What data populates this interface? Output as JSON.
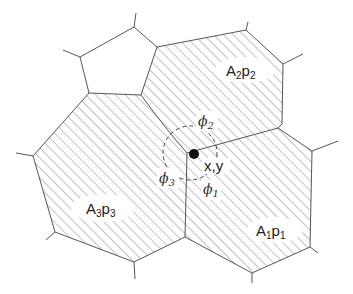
{
  "diagram": {
    "type": "grain-junction / polygon cell diagram",
    "colors": {
      "stroke": "#555555",
      "hatch": "#777777",
      "point": "#111111",
      "background": "#ffffff"
    },
    "regions": [
      {
        "id": "A1",
        "label": "A",
        "sub": "1",
        "label2": "p",
        "sub2": "1",
        "hatched": true
      },
      {
        "id": "A2",
        "label": "A",
        "sub": "2",
        "label2": "p",
        "sub2": "2",
        "hatched": true
      },
      {
        "id": "A3",
        "label": "A",
        "sub": "3",
        "label2": "p",
        "sub2": "3",
        "hatched": true
      },
      {
        "id": "empty-cell",
        "hatched": false
      }
    ],
    "junction": {
      "label": "x,y"
    },
    "angles": [
      {
        "symbol": "ϕ",
        "sub": "1"
      },
      {
        "symbol": "ϕ",
        "sub": "2"
      },
      {
        "symbol": "ϕ",
        "sub": "3"
      }
    ]
  }
}
